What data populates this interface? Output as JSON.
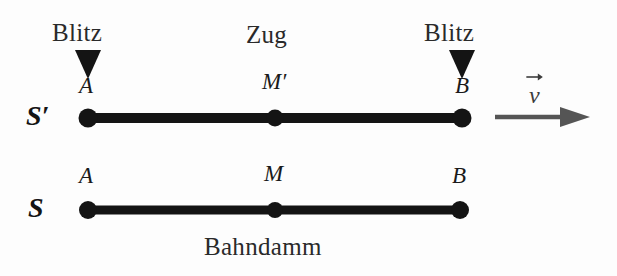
{
  "figure": {
    "title_caption_train": "Zug",
    "title_caption_ground": "Bahndamm",
    "background_color": "#fdfdfd",
    "ink_color": "#1a1a1a",
    "arrow_color": "#555555"
  },
  "flashes": [
    {
      "id": "flash-left",
      "label": "Blitz",
      "marker": "triangle-down-marker",
      "x": 88
    },
    {
      "id": "flash-right",
      "label": "Blitz",
      "marker": "triangle-down-marker",
      "x": 462
    }
  ],
  "frames": [
    {
      "id": "frame-train",
      "name": "S'",
      "name_base": "S",
      "name_prime": "′",
      "caption": "Zug",
      "points": [
        {
          "id": "point-a-train",
          "label": "A",
          "prime": "",
          "x": 88,
          "y": 118
        },
        {
          "id": "point-m-train",
          "label": "M",
          "prime": "′",
          "x": 275,
          "y": 118
        },
        {
          "id": "point-b-train",
          "label": "B",
          "prime": "",
          "x": 462,
          "y": 118
        }
      ],
      "rod_y": 118,
      "rod_x1": 88,
      "rod_x2": 462
    },
    {
      "id": "frame-ground",
      "name": "S",
      "name_base": "S",
      "name_prime": "",
      "caption": "Bahndamm",
      "points": [
        {
          "id": "point-a-ground",
          "label": "A",
          "prime": "",
          "x": 88,
          "y": 210
        },
        {
          "id": "point-m-ground",
          "label": "M",
          "prime": "",
          "x": 275,
          "y": 210
        },
        {
          "id": "point-b-ground",
          "label": "B",
          "prime": "",
          "x": 462,
          "y": 210
        }
      ],
      "rod_y": 210,
      "rod_x1": 88,
      "rod_x2": 460
    }
  ],
  "velocity": {
    "label": "v",
    "accent": "vector-arrow-accent",
    "arrow_x1": 495,
    "arrow_x2": 588,
    "arrow_y": 117
  },
  "labels": {
    "blitz_left": "Blitz",
    "blitz_right": "Blitz",
    "zug": "Zug",
    "bahndamm": "Bahndamm",
    "frame_train_base": "S",
    "frame_train_prime": "′",
    "frame_ground": "S",
    "a_train": "A",
    "m_train": "M",
    "m_train_prime": "′",
    "b_train": "B",
    "a_ground": "A",
    "m_ground": "M",
    "b_ground": "B",
    "velocity": "v"
  }
}
